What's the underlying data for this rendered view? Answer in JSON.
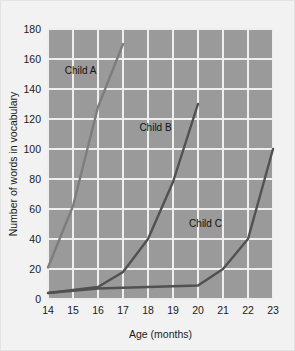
{
  "chart_data": {
    "type": "line",
    "title": "",
    "xlabel": "Age (months)",
    "ylabel": "Number of words in vocabulary",
    "xlim": [
      14,
      23
    ],
    "ylim": [
      0,
      180
    ],
    "grid": true,
    "legend": "inline-labels",
    "x_ticks": [
      "14",
      "15",
      "16",
      "17",
      "18",
      "19",
      "20",
      "21",
      "22",
      "23"
    ],
    "y_ticks": [
      "0",
      "20",
      "40",
      "60",
      "80",
      "100",
      "120",
      "140",
      "160",
      "180"
    ],
    "x": [
      14,
      15,
      16,
      17,
      18,
      19,
      20,
      21,
      22,
      23
    ],
    "series": [
      {
        "name": "Child A",
        "color": "#7d7d7d",
        "label_x": 15.3,
        "label_y": 150,
        "points": [
          {
            "x": 14,
            "y": 21
          },
          {
            "x": 15,
            "y": 62
          },
          {
            "x": 16,
            "y": 128
          },
          {
            "x": 17,
            "y": 170
          }
        ]
      },
      {
        "name": "Child B",
        "color": "#515151",
        "label_x": 18.3,
        "label_y": 112,
        "points": [
          {
            "x": 14,
            "y": 4
          },
          {
            "x": 15,
            "y": 6
          },
          {
            "x": 16,
            "y": 8
          },
          {
            "x": 17,
            "y": 18
          },
          {
            "x": 18,
            "y": 40
          },
          {
            "x": 19,
            "y": 78
          },
          {
            "x": 20,
            "y": 130
          }
        ]
      },
      {
        "name": "Child C",
        "color": "#515151",
        "label_x": 20.3,
        "label_y": 48,
        "points": [
          {
            "x": 14,
            "y": 4
          },
          {
            "x": 16,
            "y": 7
          },
          {
            "x": 18,
            "y": 8
          },
          {
            "x": 20,
            "y": 9
          },
          {
            "x": 21,
            "y": 20
          },
          {
            "x": 22,
            "y": 40
          },
          {
            "x": 23,
            "y": 100
          }
        ]
      }
    ]
  },
  "figure": {
    "plot_background": "#9a9a9a",
    "page_background": "#f2f2f2",
    "gridline_color": "#efefef"
  }
}
